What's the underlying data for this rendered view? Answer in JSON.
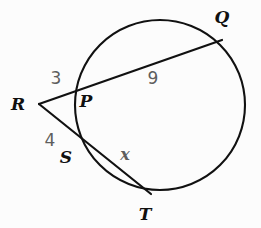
{
  "figure": {
    "background_color": "#fcfcfc",
    "stroke_color": "#111111",
    "label_color": "#101010",
    "measure_color": "#5e5e5e"
  },
  "circle": {
    "center_x": 160,
    "center_y": 105,
    "radius": 85
  },
  "points": {
    "R": {
      "label": "R",
      "x": 39,
      "y": 104,
      "label_x": 18,
      "label_y": 110
    },
    "P": {
      "label": "P",
      "x": 83,
      "y": 86,
      "label_x": 86,
      "label_y": 107
    },
    "Q": {
      "label": "Q",
      "x": 222,
      "y": 40,
      "label_x": 222,
      "label_y": 23
    },
    "S": {
      "label": "S",
      "x": 88,
      "y": 137,
      "label_x": 66,
      "label_y": 163
    },
    "T": {
      "label": "T",
      "x": 151,
      "y": 194,
      "label_x": 145,
      "label_y": 220
    }
  },
  "segments": [
    {
      "name": "secant-R-Q",
      "from": "R",
      "to": "Q"
    },
    {
      "name": "secant-R-T",
      "from": "R",
      "to": "T"
    }
  ],
  "measures": {
    "RP": {
      "value": "3",
      "x": 56,
      "y": 84
    },
    "PQ": {
      "value": "9",
      "x": 153,
      "y": 84
    },
    "RS": {
      "value": "4",
      "x": 50,
      "y": 146
    },
    "ST": {
      "value": "x",
      "x": 125,
      "y": 160
    }
  },
  "chart_data": {
    "type": "diagram",
    "subtype": "euclidean-geometry-circle-secants",
    "circle": {
      "center": [
        160,
        105
      ],
      "radius": 85
    },
    "labeled_points": [
      "R",
      "P",
      "Q",
      "S",
      "T"
    ],
    "known_lengths": {
      "RP": 3,
      "PQ": 9,
      "RS": 4
    },
    "unknown_lengths": {
      "ST": "x"
    },
    "relation": "RP * RQ = RS * RT"
  }
}
